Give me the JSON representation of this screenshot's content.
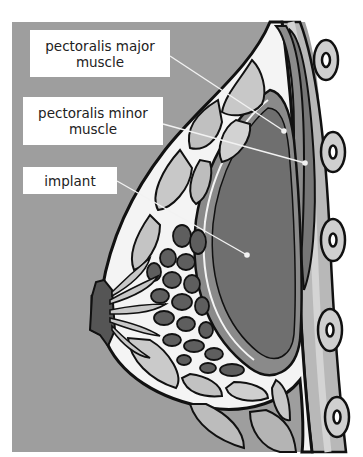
{
  "diagram": {
    "background_color": "#9e9e9e",
    "labels": [
      {
        "id": "pectoralis-major",
        "lines": [
          "pectoralis major",
          "muscle"
        ],
        "target": [
          284,
          131
        ]
      },
      {
        "id": "pectoralis-minor",
        "lines": [
          "pectoralis minor",
          "muscle"
        ],
        "target": [
          305,
          163
        ]
      },
      {
        "id": "implant",
        "lines": [
          "implant"
        ],
        "target": [
          247,
          255
        ]
      }
    ],
    "colors": {
      "panel": "#9e9e9e",
      "outline": "#111111",
      "tissue_white": "#f4f4f4",
      "fat_light": "#c8c8c8",
      "fat_mid": "#b0b0b0",
      "gland_dark": "#5e5e5e",
      "implant_fill": "#6f6f6f",
      "implant_shell": "#8a8a8a",
      "muscle_major": "#8c8c8c",
      "muscle_minor": "#747474",
      "rib_band": "#b8b8b8",
      "rib_light": "#d6d6d6",
      "pointer": "#f2f2f2"
    }
  }
}
